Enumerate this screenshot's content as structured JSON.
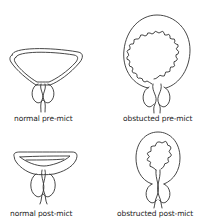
{
  "diagram": {
    "panels": [
      {
        "id": "normal-pre",
        "label": "normal pre-mict"
      },
      {
        "id": "obstructed-pre",
        "label": "obstucted pre-mict"
      },
      {
        "id": "normal-post",
        "label": "normal post-mict"
      },
      {
        "id": "obstructed-post",
        "label": "obstructed post-mict"
      }
    ],
    "colors": {
      "stroke": "#333333",
      "background": "#ffffff",
      "text": "#222222"
    }
  }
}
